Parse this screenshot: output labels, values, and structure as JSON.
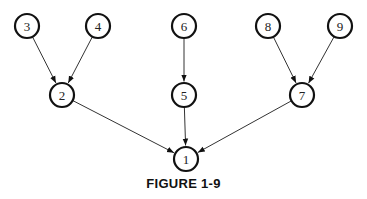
{
  "caption": "FIGURE 1-9",
  "nodes": [
    {
      "id": "1",
      "x": 186,
      "y": 159
    },
    {
      "id": "2",
      "x": 62,
      "y": 95
    },
    {
      "id": "3",
      "x": 27,
      "y": 26
    },
    {
      "id": "4",
      "x": 98,
      "y": 26
    },
    {
      "id": "5",
      "x": 184,
      "y": 95
    },
    {
      "id": "6",
      "x": 184,
      "y": 26
    },
    {
      "id": "7",
      "x": 302,
      "y": 95
    },
    {
      "id": "8",
      "x": 268,
      "y": 26
    },
    {
      "id": "9",
      "x": 340,
      "y": 26
    }
  ],
  "edges": [
    {
      "from": "3",
      "to": "2"
    },
    {
      "from": "4",
      "to": "2"
    },
    {
      "from": "6",
      "to": "5"
    },
    {
      "from": "8",
      "to": "7"
    },
    {
      "from": "9",
      "to": "7"
    },
    {
      "from": "2",
      "to": "1"
    },
    {
      "from": "5",
      "to": "1"
    },
    {
      "from": "7",
      "to": "1"
    }
  ]
}
